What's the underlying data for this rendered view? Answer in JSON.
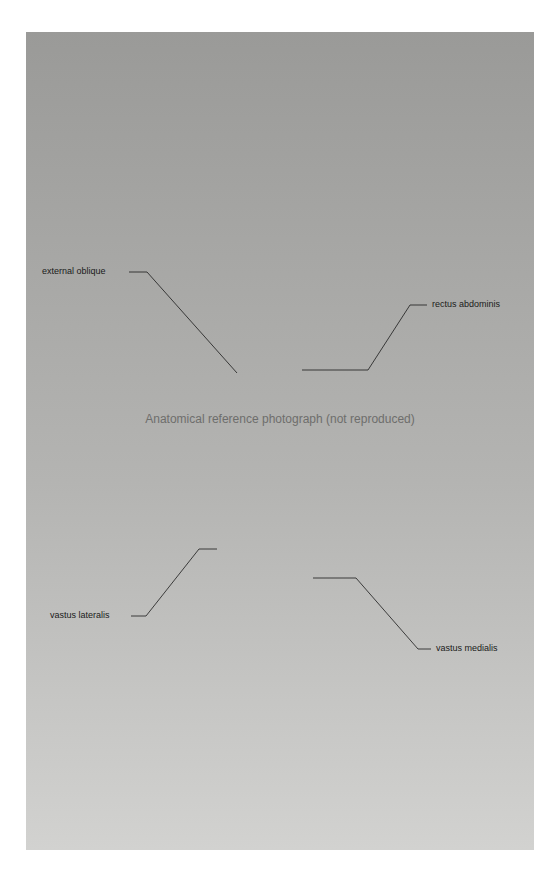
{
  "figure": {
    "placeholder_note": "Anatomical reference photograph (not reproduced)",
    "labels": [
      {
        "id": "external-oblique",
        "text": "external oblique"
      },
      {
        "id": "rectus-abdominis",
        "text": "rectus abdominis"
      },
      {
        "id": "vastus-lateralis",
        "text": "vastus lateralis"
      },
      {
        "id": "vastus-medialis",
        "text": "vastus medialis"
      }
    ]
  }
}
